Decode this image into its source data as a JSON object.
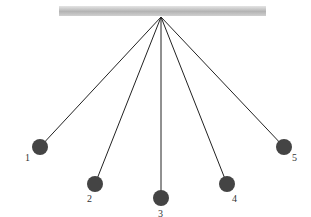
{
  "diagram": {
    "title": "",
    "support_bar": {
      "x1": 59,
      "x2": 266,
      "y": 6,
      "height": 10,
      "color_top": "#e4e4e4",
      "color_mid": "#b4b4b4",
      "color_bottom": "#d0d0d0"
    },
    "pivot": {
      "x": 161,
      "y": 17
    },
    "string_color": "#222222",
    "ball_color": "#444444",
    "ball_radius": 8,
    "pendulums": [
      {
        "label": "1",
        "x": 40,
        "y": 147,
        "label_x": 25,
        "label_y": 161
      },
      {
        "label": "2",
        "x": 95,
        "y": 184,
        "label_x": 87,
        "label_y": 202
      },
      {
        "label": "3",
        "x": 161,
        "y": 198,
        "label_x": 158,
        "label_y": 217
      },
      {
        "label": "4",
        "x": 227,
        "y": 184,
        "label_x": 232,
        "label_y": 202
      },
      {
        "label": "5",
        "x": 284,
        "y": 147,
        "label_x": 292,
        "label_y": 161
      }
    ]
  }
}
